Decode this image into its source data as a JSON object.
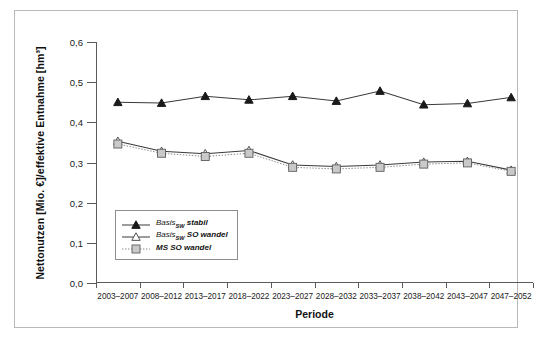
{
  "chart_data": {
    "type": "line",
    "title": "",
    "xlabel": "Periode",
    "ylabel": "Nettonutzen [Mio. €]/effektive Entnahme [hm³]",
    "ylim": [
      0.0,
      0.6
    ],
    "ytick_values": [
      0.0,
      0.1,
      0.2,
      0.3,
      0.4,
      0.5,
      0.6
    ],
    "ytick_labels": [
      "0,0",
      "0,1",
      "0,2",
      "0,3",
      "0,4",
      "0,5",
      "0,6"
    ],
    "grid": false,
    "legend_position": "lower-left-inside",
    "categories": [
      "2003–2007",
      "2008–2012",
      "2013–2017",
      "2018–2022",
      "2023–2027",
      "2028–2032",
      "2033–2037",
      "2038–2042",
      "2043–2047",
      "2047–2052"
    ],
    "series": [
      {
        "name": "Basis_SW stabil",
        "label_main": "Basis",
        "label_sub": "SW",
        "label_tail": "stabil",
        "marker": "filled-triangle",
        "line": "solid",
        "color": "#1a1a1a",
        "values": [
          0.45,
          0.448,
          0.465,
          0.456,
          0.465,
          0.453,
          0.478,
          0.444,
          0.447,
          0.462
        ]
      },
      {
        "name": "Basis_SW SO wandel",
        "label_main": "Basis",
        "label_sub": "SW",
        "label_tail": "SO wandel",
        "marker": "open-triangle",
        "line": "solid",
        "color": "#555555",
        "values": [
          0.353,
          0.328,
          0.322,
          0.33,
          0.294,
          0.29,
          0.294,
          0.301,
          0.303,
          0.281
        ]
      },
      {
        "name": "MS SO wandel",
        "label_main": "MS SO wandel",
        "label_sub": "",
        "label_tail": "",
        "marker": "gray-square",
        "line": "dotted",
        "color": "#8c8c8c",
        "values": [
          0.346,
          0.323,
          0.315,
          0.323,
          0.288,
          0.284,
          0.288,
          0.296,
          0.299,
          0.278
        ]
      }
    ]
  },
  "axis": {
    "y_title": "Nettonutzen [Mio. €]/effektive Entnahme [hm³]",
    "x_title": "Periode"
  },
  "legend": {
    "items": [
      {
        "text": "Basis",
        "sub": "SW",
        "tail": "stabil"
      },
      {
        "text": "Basis",
        "sub": "SW",
        "tail": "SO wandel"
      },
      {
        "text": "MS SO wandel",
        "sub": "",
        "tail": ""
      }
    ]
  },
  "colors": {
    "frame": "#b9b9b9",
    "axis": "#5a5a5a",
    "series1": "#1a1a1a",
    "series2": "#555555",
    "series3": "#8c8c8c",
    "background": "#ffffff"
  }
}
